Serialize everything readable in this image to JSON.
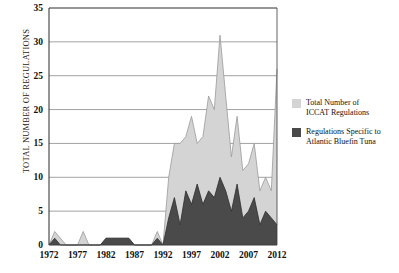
{
  "chart_data": {
    "type": "area",
    "title": "",
    "subtitle": "",
    "xlabel": "",
    "ylabel": "TOTAL NUMBER OF REGULATIONS",
    "xlim": [
      1972,
      2012
    ],
    "ylim": [
      0,
      35
    ],
    "yticks": [
      0,
      5,
      10,
      15,
      20,
      25,
      30,
      35
    ],
    "xticks": [
      1972,
      1977,
      1982,
      1987,
      1992,
      1997,
      2002,
      2007,
      2012
    ],
    "grid": true,
    "legend_position": "right",
    "x": [
      1972,
      1973,
      1974,
      1975,
      1976,
      1977,
      1978,
      1979,
      1980,
      1981,
      1982,
      1983,
      1984,
      1985,
      1986,
      1987,
      1988,
      1989,
      1990,
      1991,
      1992,
      1993,
      1994,
      1995,
      1996,
      1997,
      1998,
      1999,
      2000,
      2001,
      2002,
      2003,
      2004,
      2005,
      2006,
      2007,
      2008,
      2009,
      2010,
      2011,
      2012
    ],
    "series": [
      {
        "name": "Total Number of ICCAT Regulations",
        "color": "#d4d4d4",
        "values": [
          0,
          2,
          1,
          0,
          0,
          0,
          2,
          0,
          0,
          0,
          1,
          1,
          1,
          1,
          1,
          0,
          0,
          0,
          0,
          2,
          0,
          10,
          15,
          15,
          16,
          19,
          15,
          16,
          22,
          20,
          31,
          22,
          13,
          19,
          11,
          12,
          15,
          8,
          10,
          8,
          26
        ]
      },
      {
        "name": "Regulations Specific to Atlantic Bluefin Tuna",
        "color": "#4a4a4a",
        "values": [
          0,
          1,
          0,
          0,
          0,
          0,
          0,
          0,
          0,
          0,
          1,
          1,
          1,
          1,
          1,
          0,
          0,
          0,
          0,
          1,
          0,
          4,
          7,
          3,
          8,
          6,
          9,
          6,
          8,
          7,
          10,
          8,
          5,
          9,
          4,
          5,
          7,
          3,
          5,
          4,
          3
        ]
      }
    ],
    "legend": [
      {
        "label_line1": "Total Number of",
        "label_line2": "ICCAT Regulations",
        "color": "#d4d4d4"
      },
      {
        "label_line1": "Regulations Specific to",
        "label_line2": "Atlantic Bluefin Tuna",
        "color": "#4a4a4a"
      }
    ],
    "colors": {
      "total": "#d4d4d4",
      "bluefin": "#4a4a4a",
      "axis": "#3c3c3c",
      "grid": "#8a8a8a",
      "background": "#ffffff"
    }
  }
}
